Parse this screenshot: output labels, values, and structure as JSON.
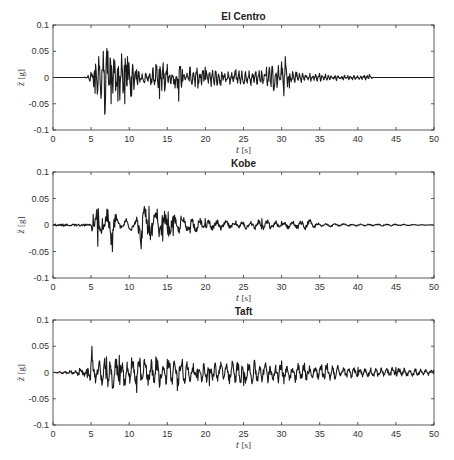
{
  "chart_data": [
    {
      "type": "line",
      "title": "El Centro",
      "xlabel": "t [s]",
      "ylabel": "z̈ [g]",
      "xlim": [
        0,
        50
      ],
      "ylim": [
        -0.1,
        0.1
      ],
      "xticks": [
        0,
        5,
        10,
        15,
        20,
        25,
        30,
        35,
        40,
        45,
        50
      ],
      "yticks": [
        -0.1,
        -0.05,
        0,
        0.05,
        0.1
      ],
      "grid": false,
      "series": [
        {
          "name": "El Centro",
          "envelope": [
            [
              0,
              0
            ],
            [
              4,
              0
            ],
            [
              4.5,
              0.003
            ],
            [
              5,
              0.01
            ],
            [
              5.5,
              -0.03
            ],
            [
              6,
              0.04
            ],
            [
              6.3,
              -0.04
            ],
            [
              6.6,
              0.05
            ],
            [
              6.8,
              -0.07
            ],
            [
              7.2,
              0.05
            ],
            [
              7.6,
              -0.05
            ],
            [
              8,
              0.035
            ],
            [
              8.5,
              -0.045
            ],
            [
              9,
              0.045
            ],
            [
              9.4,
              -0.05
            ],
            [
              9.8,
              0.04
            ],
            [
              10.3,
              -0.035
            ],
            [
              11,
              0.015
            ],
            [
              12,
              -0.01
            ],
            [
              13.5,
              0.025
            ],
            [
              14,
              -0.04
            ],
            [
              15,
              0.025
            ],
            [
              16,
              -0.02
            ],
            [
              16.5,
              -0.045
            ],
            [
              17,
              0.015
            ],
            [
              18,
              0.02
            ],
            [
              19,
              -0.02
            ],
            [
              20,
              0.02
            ],
            [
              22,
              -0.015
            ],
            [
              24,
              0.015
            ],
            [
              26,
              -0.015
            ],
            [
              28,
              0.02
            ],
            [
              29,
              -0.025
            ],
            [
              30,
              0.03
            ],
            [
              30.5,
              0.04
            ],
            [
              31,
              -0.02
            ],
            [
              32,
              0.01
            ],
            [
              35,
              0.008
            ],
            [
              40,
              0.004
            ],
            [
              41.5,
              0.006
            ],
            [
              42,
              0
            ],
            [
              50,
              0
            ]
          ]
        }
      ]
    },
    {
      "type": "line",
      "title": "Kobe",
      "xlabel": "t [s]",
      "ylabel": "z̈ [g]",
      "xlim": [
        0,
        50
      ],
      "ylim": [
        -0.1,
        0.1
      ],
      "xticks": [
        0,
        5,
        10,
        15,
        20,
        25,
        30,
        35,
        40,
        45,
        50
      ],
      "yticks": [
        -0.1,
        -0.05,
        0,
        0.05,
        0.1
      ],
      "grid": false,
      "series": [
        {
          "name": "Kobe",
          "envelope": [
            [
              0,
              0
            ],
            [
              4.8,
              0.002
            ],
            [
              5.3,
              0.02
            ],
            [
              5.9,
              -0.04
            ],
            [
              6.5,
              0.012
            ],
            [
              7.1,
              0.03
            ],
            [
              7.8,
              -0.05
            ],
            [
              8.3,
              0.02
            ],
            [
              9,
              -0.005
            ],
            [
              9.6,
              0.012
            ],
            [
              10.3,
              -0.01
            ],
            [
              11,
              0.015
            ],
            [
              11.6,
              -0.045
            ],
            [
              12.2,
              0.03
            ],
            [
              12.6,
              0.035
            ],
            [
              13,
              -0.02
            ],
            [
              13.7,
              0.03
            ],
            [
              14.4,
              -0.03
            ],
            [
              15.1,
              0.025
            ],
            [
              15.8,
              -0.02
            ],
            [
              16.8,
              0.017
            ],
            [
              18,
              -0.015
            ],
            [
              20,
              0.012
            ],
            [
              22,
              -0.01
            ],
            [
              24,
              0.008
            ],
            [
              27.4,
              0.012
            ],
            [
              30,
              0.007
            ],
            [
              33.8,
              0.01
            ],
            [
              35,
              0.004
            ],
            [
              40,
              0.002
            ],
            [
              45,
              0.002
            ],
            [
              50,
              0
            ]
          ]
        }
      ]
    },
    {
      "type": "line",
      "title": "Taft",
      "xlabel": "t [s]",
      "ylabel": "z̈ [g]",
      "xlim": [
        0,
        50
      ],
      "ylim": [
        -0.1,
        0.1
      ],
      "xticks": [
        0,
        5,
        10,
        15,
        20,
        25,
        30,
        35,
        40,
        45,
        50
      ],
      "yticks": [
        -0.1,
        -0.05,
        0,
        0.05,
        0.1
      ],
      "grid": false,
      "series": [
        {
          "name": "Taft",
          "envelope": [
            [
              0,
              0
            ],
            [
              3.5,
              0.008
            ],
            [
              4.5,
              -0.01
            ],
            [
              5.1,
              0.05
            ],
            [
              5.6,
              -0.02
            ],
            [
              7,
              0.03
            ],
            [
              7.8,
              -0.03
            ],
            [
              8.7,
              0.033
            ],
            [
              9.3,
              -0.025
            ],
            [
              10.3,
              0.028
            ],
            [
              11,
              -0.038
            ],
            [
              12,
              0.025
            ],
            [
              13.5,
              0.03
            ],
            [
              14,
              -0.028
            ],
            [
              15,
              0.025
            ],
            [
              16.3,
              -0.034
            ],
            [
              17,
              0.025
            ],
            [
              19,
              -0.015
            ],
            [
              20.5,
              -0.025
            ],
            [
              22,
              0.02
            ],
            [
              25,
              -0.025
            ],
            [
              30,
              0.022
            ],
            [
              33,
              0.018
            ],
            [
              36,
              0.017
            ],
            [
              40,
              0.01
            ],
            [
              45,
              0.01
            ],
            [
              50,
              0.005
            ]
          ]
        }
      ]
    }
  ],
  "panels": [
    {
      "title": "El Centro"
    },
    {
      "title": "Kobe"
    },
    {
      "title": "Taft"
    }
  ],
  "axes": {
    "xlabel_var": "t",
    "xlabel_unit": "[s]",
    "ylabel_var": "z̈",
    "ylabel_unit": "[g]",
    "xtick_labels": [
      "0",
      "5",
      "10",
      "15",
      "20",
      "25",
      "30",
      "35",
      "40",
      "45",
      "50"
    ],
    "ytick_labels": [
      "-0.1",
      "-0.05",
      "0",
      "0.05",
      "0.1"
    ]
  },
  "style": {
    "line_color": "#1a1a1a",
    "axis_color": "#333333"
  }
}
